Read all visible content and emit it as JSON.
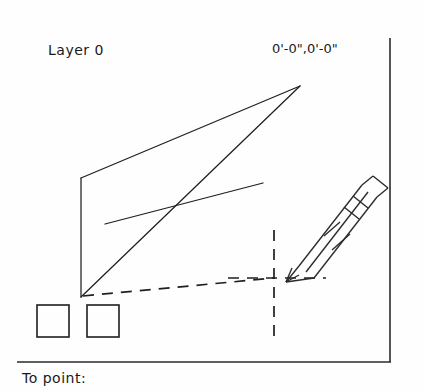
{
  "canvas": {
    "layer_label": "Layer 0",
    "coordinate_readout": "0'-0\",0'-0\"",
    "background_color": "#fefefe",
    "line_color": "#1f1f1f"
  },
  "command_bar": {
    "prompt": "To point:"
  },
  "drawing": {
    "apex_point": "300,86",
    "left_top_point": "81,178",
    "left_bottom_point": "81,297",
    "cross_point": "178,205",
    "crosshair_center": "274,278",
    "shallow_line_start": "105,224",
    "shallow_line_end": "263,183"
  },
  "toolbar": {
    "buttons": [
      {
        "name": "tool-box-1",
        "label": ""
      },
      {
        "name": "tool-box-2",
        "label": ""
      }
    ]
  },
  "cursor": {
    "type": "pencil-cursor"
  }
}
